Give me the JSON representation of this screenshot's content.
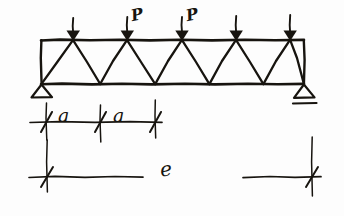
{
  "figure": {
    "name": "simply-supported-warren-truss-sketch",
    "style": "hand-drawn pencil sketch",
    "ink_color": "#17140f",
    "background_color": "#fdfdfd",
    "width": 344,
    "height": 216
  },
  "truss": {
    "type": "warren-truss",
    "panel_count": 5,
    "top_chord": {
      "y": 40,
      "x_start": 41,
      "x_end": 304
    },
    "bottom_chord": {
      "y": 84,
      "x_start": 41,
      "x_end": 304
    },
    "top_nodes_x": [
      73,
      127,
      182,
      236,
      290
    ],
    "bottom_nodes_x": [
      41,
      100,
      155,
      209,
      263,
      304
    ],
    "has_end_posts": true
  },
  "loads": {
    "count": 5,
    "direction": "down",
    "arrows_x": [
      73,
      127,
      182,
      236,
      290
    ],
    "arrow_top_y": 18,
    "arrow_tip_y": 40,
    "labels": [
      {
        "text": "P",
        "x": 133,
        "y": 12
      },
      {
        "text": "P",
        "x": 188,
        "y": 12
      }
    ],
    "label_text": "P"
  },
  "supports": {
    "left": {
      "kind": "pin-support",
      "x": 41,
      "y": 84
    },
    "right": {
      "kind": "roller-support",
      "x": 304,
      "y": 84,
      "has_ground_line": true
    }
  },
  "dimensions": {
    "panel": {
      "label": "a",
      "count": 2,
      "tick_x": [
        46,
        100,
        155
      ],
      "line_y": 122,
      "labels": [
        {
          "text": "a",
          "x": 61,
          "y": 108
        },
        {
          "text": "a",
          "x": 116,
          "y": 108
        }
      ]
    },
    "span": {
      "label": "e",
      "line_y": 177,
      "x_start": 30,
      "x_end": 320,
      "tick_x": [
        47,
        312
      ],
      "label_pos": {
        "x": 163,
        "y": 163
      }
    },
    "extension_lines": [
      {
        "x": 47,
        "y_top": 102,
        "y_bottom": 190
      },
      {
        "x": 312,
        "y_top": 140,
        "y_bottom": 196
      },
      {
        "x": 100,
        "y_top": 104,
        "y_bottom": 140
      },
      {
        "x": 155,
        "y_top": 100,
        "y_bottom": 136
      }
    ]
  }
}
